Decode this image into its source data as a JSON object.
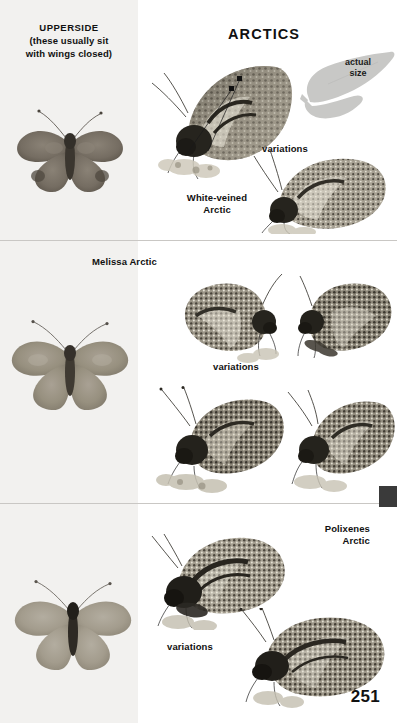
{
  "page": {
    "number": "251",
    "section_title": "ARCTICS",
    "left_column_heading": "UPPERSIDE",
    "left_column_subheading_line1": "(these usually sit",
    "left_column_subheading_line2": "with wings closed)",
    "actual_size_line1": "actual",
    "actual_size_line2": "size",
    "background_color": "#ffffff",
    "left_column_color": "#f2f1ef",
    "divider_color": "#c9c7c4",
    "edge_tab_color": "#3a3a3a"
  },
  "panels": [
    {
      "id": "white-veined-arctic",
      "species_label_line1": "White-veined",
      "species_label_line2": "Arctic",
      "variations_label": "variations",
      "upperside_caption": "",
      "has_actual_size_silhouette": true
    },
    {
      "id": "melissa-arctic",
      "species_label_line1": "Melissa Arctic",
      "species_label_line2": "",
      "variations_label": "variations",
      "upperside_caption": "",
      "has_actual_size_silhouette": false
    },
    {
      "id": "polixenes-arctic",
      "species_label_line1": "Polixenes",
      "species_label_line2": "Arctic",
      "variations_label": "variations",
      "upperside_caption": "",
      "has_actual_size_silhouette": false
    }
  ],
  "icons": {
    "butterfly_upperside": "butterfly-upperside-icon",
    "butterfly_sideview": "butterfly-sideview-icon",
    "silhouette": "butterfly-silhouette-icon",
    "pointer": "pointer-dot-icon"
  }
}
